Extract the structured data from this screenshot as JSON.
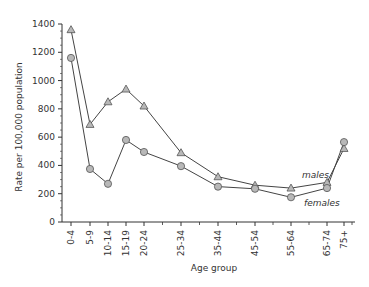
{
  "chart_data": {
    "type": "line",
    "title": "",
    "xlabel": "Age group",
    "ylabel": "Rate per 100,000 population",
    "ylim": [
      0,
      1400
    ],
    "yticks": [
      0,
      200,
      400,
      600,
      800,
      1000,
      1200,
      1400
    ],
    "categories": [
      "0-4",
      "5-9",
      "10-14",
      "15-19",
      "20-24",
      "25-34",
      "35-44",
      "45-54",
      "55-64",
      "65-74",
      "75+"
    ],
    "series": [
      {
        "name": "males",
        "marker": "triangle",
        "values": [
          1360,
          690,
          850,
          940,
          820,
          490,
          320,
          260,
          240,
          280,
          520
        ]
      },
      {
        "name": "females",
        "marker": "circle",
        "values": [
          1160,
          375,
          270,
          580,
          495,
          395,
          250,
          235,
          175,
          240,
          565
        ]
      }
    ],
    "grid": false,
    "legend": "inline labels near right end of lines"
  },
  "colors": {
    "line": "#444444",
    "marker_fill": "#b8b8b8",
    "marker_stroke": "#555555",
    "axis": "#333333"
  }
}
